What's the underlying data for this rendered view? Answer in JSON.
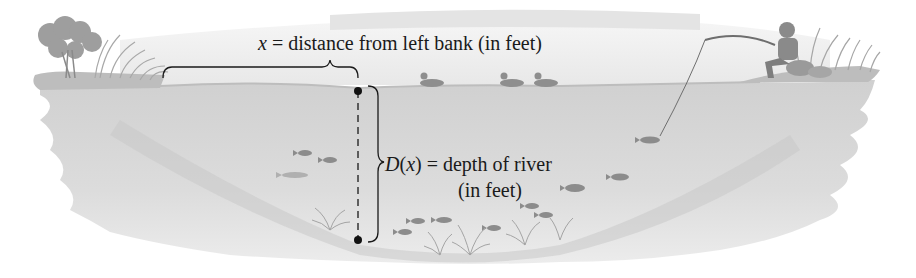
{
  "figure": {
    "x_label": {
      "variable": "x",
      "equals": " = ",
      "text": "distance from left bank (in feet)"
    },
    "d_label": {
      "function": "D",
      "open_paren": "(",
      "variable": "x",
      "close_paren": ")",
      "equals": " = ",
      "text": "depth of river",
      "units": "(in feet)"
    },
    "scene_elements": [
      "trees-left-bank",
      "fisherman-right-bank",
      "ducks",
      "fish",
      "water-plants",
      "river-cross-section"
    ],
    "colors": {
      "water": "#d6d6d6",
      "water_light": "#e6e6e6",
      "bank": "#c4c4c4",
      "sky": "#ececec",
      "ink": "#1a1a1a",
      "fish": "#8a8a8a",
      "vegetation": "#9a9a9a"
    }
  }
}
